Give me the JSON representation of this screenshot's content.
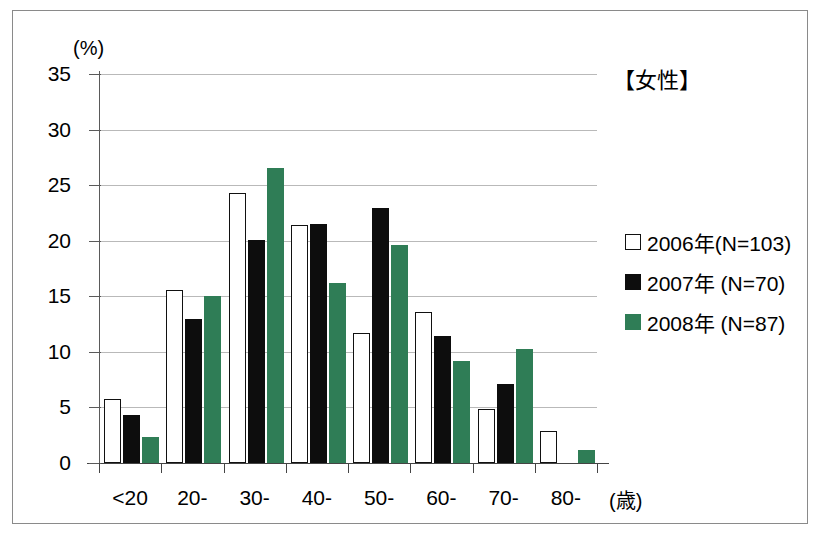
{
  "chart_data": {
    "type": "bar",
    "title": "【女性】",
    "xlabel": "(歳)",
    "ylabel": "(%)",
    "categories": [
      "<20",
      "20-",
      "30-",
      "40-",
      "50-",
      "60-",
      "70-",
      "80-"
    ],
    "series": [
      {
        "name": "2006年(N=103)",
        "color": "#ffffff",
        "values": [
          5.8,
          15.6,
          24.3,
          21.4,
          11.7,
          13.6,
          4.9,
          2.9
        ]
      },
      {
        "name": "2007年 (N=70)",
        "color": "#0d0d0d",
        "values": [
          4.3,
          13.0,
          20.1,
          21.5,
          22.9,
          11.4,
          7.1,
          0
        ]
      },
      {
        "name": "2008年 (N=87)",
        "color": "#2f7d56",
        "values": [
          2.3,
          15.0,
          26.5,
          16.2,
          19.6,
          9.2,
          10.3,
          1.2
        ]
      }
    ],
    "ylim": [
      0,
      35
    ],
    "yticks": [
      0,
      5,
      10,
      15,
      20,
      25,
      30,
      35
    ],
    "ytick_labels": [
      "0",
      "5",
      "10",
      "15",
      "20",
      "25",
      "30",
      "35"
    ],
    "grid": true,
    "legend_position": "right"
  },
  "legend": {
    "entries": [
      {
        "label": "2006年(N=103)",
        "swatch": "open-square"
      },
      {
        "label": "2007年 (N=70)",
        "swatch": "filled-black-square"
      },
      {
        "label": "2008年 (N=87)",
        "swatch": "filled-green-square"
      }
    ]
  },
  "colors": {
    "series_2006": "#ffffff",
    "series_2007": "#0d0d0d",
    "series_2008": "#2f7d56",
    "grid": "#b9b9b9",
    "axis": "#444444",
    "border": "#8a8a8a"
  }
}
